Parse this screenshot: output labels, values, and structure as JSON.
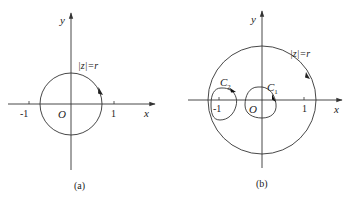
{
  "figures": [
    {
      "id": "a",
      "caption": "(a)",
      "x_axis_label": "x",
      "y_axis_label": "y",
      "origin_label": "O",
      "ticks": [
        "-1",
        "1"
      ],
      "circle_label": "|z|=r"
    },
    {
      "id": "b",
      "caption": "(b)",
      "x_axis_label": "x",
      "y_axis_label": "y",
      "origin_label": "O",
      "ticks": [
        "-1",
        "1"
      ],
      "circle_label": "|z|=r",
      "contours": [
        {
          "name": "C",
          "subscript": "2"
        },
        {
          "name": "C",
          "subscript": "1"
        }
      ]
    }
  ],
  "colors": {
    "stroke": "#333333",
    "background": "#ffffff"
  }
}
